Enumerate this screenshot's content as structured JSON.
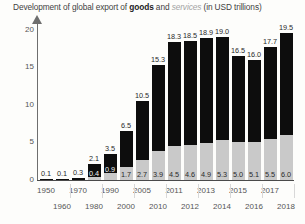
{
  "title": {
    "prefix": "Development of global export of ",
    "goods": "goods",
    "middle": " and ",
    "services": "services",
    "suffix": " (in USD trillions)"
  },
  "chart_data": {
    "type": "bar",
    "title": "Development of global export of goods and services (in USD trillions)",
    "xlabel": "",
    "ylabel": "",
    "ylim": [
      0,
      21
    ],
    "yticks": [
      0,
      5,
      10,
      15,
      20
    ],
    "grid": false,
    "legend": "inline-in-title",
    "stacked": true,
    "categories": [
      "1950",
      "1960",
      "1970",
      "1980",
      "1990",
      "2000",
      "2005",
      "2010",
      "2011",
      "2012",
      "2013",
      "2014",
      "2015",
      "2016",
      "2017",
      "2018"
    ],
    "series": [
      {
        "name": "services",
        "values": [
          null,
          null,
          null,
          0.4,
          0.9,
          1.7,
          2.7,
          3.9,
          4.5,
          4.6,
          4.9,
          5.3,
          5.0,
          5.1,
          5.5,
          6.0
        ]
      },
      {
        "name": "goods",
        "values": [
          0.1,
          0.1,
          0.3,
          1.7,
          2.6,
          4.8,
          7.8,
          11.4,
          13.8,
          13.9,
          14.0,
          13.7,
          11.5,
          10.9,
          12.2,
          13.5
        ]
      }
    ],
    "totals": [
      0.1,
      0.1,
      0.3,
      2.1,
      3.5,
      6.5,
      10.5,
      15.3,
      18.3,
      18.5,
      18.9,
      19.0,
      16.5,
      16.0,
      17.7,
      19.5
    ],
    "total_labels": [
      "0.1",
      "0.1",
      "0.3",
      "2.1",
      "3.5",
      "6.5",
      "10.5",
      "15.3",
      "18.3",
      "18.5",
      "18.9",
      "19.0",
      "16.5",
      "16.0",
      "17.7",
      "19.5"
    ],
    "services_labels": [
      "",
      "",
      "",
      "0.4",
      "0.9",
      "1.7",
      "2.7",
      "3.9",
      "4.5",
      "4.6",
      "4.9",
      "5.3",
      "5.0",
      "5.1",
      "5.5",
      "6.0"
    ],
    "colors": {
      "goods": "#0d0d0d",
      "services": "#c9c9c9",
      "axis": "#4a4a4a",
      "text": "#3c3c3c"
    }
  },
  "axis": {
    "y_ticks": [
      "0",
      "5",
      "10",
      "15",
      "20"
    ],
    "x_labels_row1": [
      "1950",
      "1970",
      "1990",
      "2005",
      "2011",
      "2013",
      "2015",
      "2017"
    ],
    "x_labels_row2": [
      "1960",
      "1980",
      "2000",
      "2010",
      "2012",
      "2014",
      "2016",
      "2018"
    ]
  }
}
